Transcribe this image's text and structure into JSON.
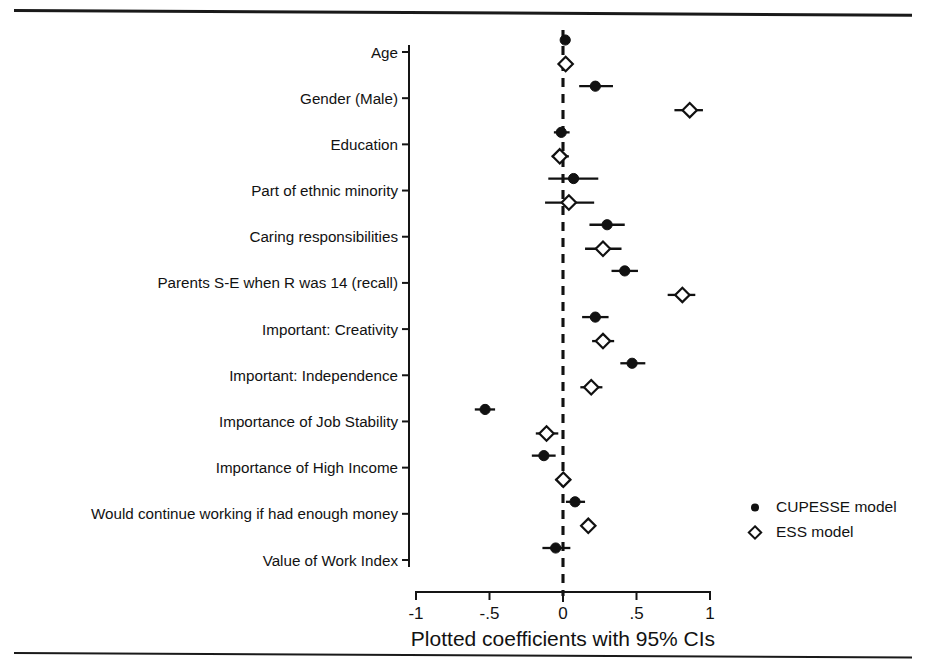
{
  "figure": {
    "rules": {
      "top": "horizontal-rule",
      "bottom": "horizontal-rule"
    }
  },
  "chart_data": {
    "type": "scatter",
    "title": "",
    "xlabel": "Plotted coefficients with 95% CIs",
    "ylabel": "",
    "xlim": [
      -1.12,
      1.12
    ],
    "xticks": [
      -1,
      -0.5,
      0,
      0.5,
      1
    ],
    "xticklabels": [
      "-1",
      "-.5",
      "0",
      ".5",
      "1"
    ],
    "grid": false,
    "reference_line": 0,
    "legend_position": "right-middle",
    "categories": [
      "Age",
      "Gender (Male)",
      "Education",
      "Part of ethnic minority",
      "Caring responsibilities",
      "Parents S-E when R was 14 (recall)",
      "Important: Creativity",
      "Important: Independence",
      "Importance of Job Stability",
      "Importance of High Income",
      "Would continue working if had enough money",
      "Value of Work Index"
    ],
    "series": [
      {
        "name": "CUPESSE model",
        "marker": "filled-circle",
        "values": [
          0.015,
          0.22,
          -0.012,
          0.072,
          0.3,
          0.42,
          0.22,
          0.47,
          -0.53,
          -0.13,
          0.082,
          -0.05
        ],
        "ci_low": [
          0.005,
          0.11,
          -0.062,
          -0.1,
          0.18,
          0.33,
          0.13,
          0.39,
          -0.6,
          -0.212,
          0.02,
          -0.14
        ],
        "ci_high": [
          0.025,
          0.34,
          0.045,
          0.24,
          0.42,
          0.51,
          0.31,
          0.56,
          -0.462,
          -0.05,
          0.15,
          0.05
        ]
      },
      {
        "name": "ESS model",
        "marker": "open-diamond",
        "values": [
          0.018,
          0.862,
          -0.022,
          0.04,
          0.272,
          0.812,
          0.272,
          0.192,
          -0.112,
          0.002,
          0.172,
          null
        ],
        "ci_low": [
          0.006,
          0.758,
          -0.076,
          -0.122,
          0.15,
          0.712,
          0.198,
          0.118,
          -0.185,
          -0.05,
          0.132,
          null
        ],
        "ci_high": [
          0.03,
          0.952,
          0.04,
          0.212,
          0.398,
          0.9,
          0.348,
          0.268,
          -0.032,
          0.052,
          0.212,
          null
        ]
      }
    ]
  },
  "legend": {
    "entries": [
      {
        "label": "CUPESSE model",
        "marker": "filled-circle"
      },
      {
        "label": "ESS model",
        "marker": "open-diamond"
      }
    ]
  }
}
